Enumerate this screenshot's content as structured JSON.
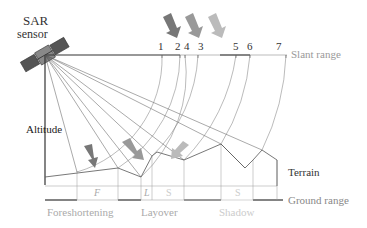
{
  "labels": {
    "sensor_line1": "SAR",
    "sensor_line2": "sensor",
    "altitude": "Altitude",
    "slant_range": "Slant range",
    "terrain": "Terrain",
    "ground_range": "Ground range",
    "foreshortening": "Foreshortening",
    "layover": "Layover",
    "shadow": "Shadow"
  },
  "slant_ticks": [
    "1",
    "2",
    "4",
    "3",
    "5",
    "6",
    "7"
  ],
  "segment_marks": {
    "F": "F",
    "L": "L",
    "S1": "S",
    "S2": "S"
  },
  "colors": {
    "dark_line": "#333333",
    "gray_text": "#999999",
    "light_text": "#c8c8c8",
    "arrow_dark": "#777777",
    "arrow_mid": "#999999",
    "arrow_light": "#bbbbbb",
    "thin_line": "#555555"
  }
}
